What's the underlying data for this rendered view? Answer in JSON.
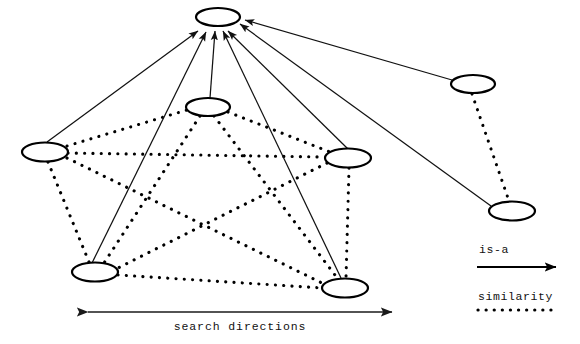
{
  "figure": {
    "title": "",
    "background_color": "#ffffff",
    "width": 580,
    "height": 344
  },
  "diagram_data": {
    "type": "node-link-diagram",
    "description": "Semantic network with is-a arrows converging on a single top concept node and dotted similarity links among sibling nodes",
    "node_shape": "ellipse",
    "node_fill": "#ffffff",
    "node_stroke": "#000000",
    "nodes": [
      {
        "id": "top",
        "label": "",
        "cx": 218,
        "cy": 17,
        "rx": 22,
        "ry": 9,
        "group": "root"
      },
      {
        "id": "left",
        "label": "",
        "cx": 45,
        "cy": 152,
        "rx": 23,
        "ry": 9.5,
        "group": "cluster-main"
      },
      {
        "id": "midtop",
        "label": "",
        "cx": 208,
        "cy": 107,
        "rx": 22,
        "ry": 9,
        "group": "cluster-main"
      },
      {
        "id": "right",
        "label": "",
        "cx": 348,
        "cy": 158,
        "rx": 23,
        "ry": 9.5,
        "group": "cluster-main"
      },
      {
        "id": "botleft",
        "label": "",
        "cx": 95,
        "cy": 272,
        "rx": 23,
        "ry": 9.5,
        "group": "cluster-main"
      },
      {
        "id": "botright",
        "label": "",
        "cx": 345,
        "cy": 288,
        "rx": 23,
        "ry": 9.5,
        "group": "cluster-main"
      },
      {
        "id": "upright",
        "label": "",
        "cx": 473,
        "cy": 84,
        "rx": 22,
        "ry": 9,
        "group": "cluster-right"
      },
      {
        "id": "lowright",
        "label": "",
        "cx": 512,
        "cy": 211,
        "rx": 23,
        "ry": 9.5,
        "group": "cluster-right"
      }
    ],
    "isa_edges": [
      {
        "from": "left",
        "to": "top"
      },
      {
        "from": "midtop",
        "to": "top"
      },
      {
        "from": "botleft",
        "to": "top"
      },
      {
        "from": "right",
        "to": "top"
      },
      {
        "from": "botright",
        "to": "top"
      },
      {
        "from": "upright",
        "to": "top"
      },
      {
        "from": "lowright",
        "to": "top"
      }
    ],
    "similarity_edges": [
      {
        "from": "left",
        "to": "midtop"
      },
      {
        "from": "left",
        "to": "right"
      },
      {
        "from": "left",
        "to": "botleft"
      },
      {
        "from": "left",
        "to": "botright"
      },
      {
        "from": "midtop",
        "to": "right"
      },
      {
        "from": "midtop",
        "to": "botleft"
      },
      {
        "from": "midtop",
        "to": "botright"
      },
      {
        "from": "right",
        "to": "botleft"
      },
      {
        "from": "right",
        "to": "botright"
      },
      {
        "from": "botleft",
        "to": "botright"
      },
      {
        "from": "upright",
        "to": "lowright"
      }
    ]
  },
  "legend": {
    "isa": {
      "label": "is-a",
      "style": "solid-arrow",
      "color": "#000000"
    },
    "similarity": {
      "label": "similarity",
      "style": "dotted-line",
      "color": "#000000"
    }
  },
  "axis": {
    "label": "search directions",
    "style": "double-headed-arrow",
    "color": "#1a1a1a"
  }
}
